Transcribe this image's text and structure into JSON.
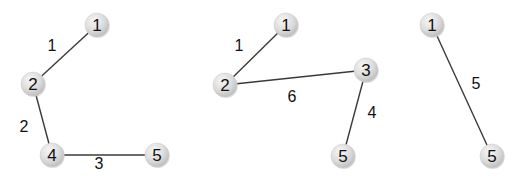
{
  "colors": {
    "background": "#ffffff",
    "edge": "#3a3a3a",
    "node_fill_light": "#f4f4f4",
    "node_fill_dark": "#c4c4c4",
    "text": "#111111"
  },
  "node_radius": 12,
  "graphs": [
    {
      "id": "graph-a",
      "nodes": [
        {
          "label": "1",
          "x": 97,
          "y": 25
        },
        {
          "label": "2",
          "x": 33,
          "y": 84
        },
        {
          "label": "4",
          "x": 52,
          "y": 155
        },
        {
          "label": "5",
          "x": 157,
          "y": 155
        }
      ],
      "edges": [
        {
          "from": "1",
          "to": "2",
          "weight": "1",
          "label_x": 52,
          "label_y": 45
        },
        {
          "from": "2",
          "to": "4",
          "weight": "2",
          "label_x": 24,
          "label_y": 126
        },
        {
          "from": "4",
          "to": "5",
          "weight": "3",
          "label_x": 99,
          "label_y": 163
        }
      ]
    },
    {
      "id": "graph-b",
      "nodes": [
        {
          "label": "1",
          "x": 286,
          "y": 25
        },
        {
          "label": "2",
          "x": 225,
          "y": 85
        },
        {
          "label": "3",
          "x": 366,
          "y": 70
        },
        {
          "label": "5",
          "x": 343,
          "y": 156
        }
      ],
      "edges": [
        {
          "from": "1",
          "to": "2",
          "weight": "1",
          "label_x": 239,
          "label_y": 45
        },
        {
          "from": "2",
          "to": "3",
          "weight": "6",
          "label_x": 292,
          "label_y": 96
        },
        {
          "from": "3",
          "to": "5",
          "weight": "4",
          "label_x": 372,
          "label_y": 112
        }
      ]
    },
    {
      "id": "graph-c",
      "nodes": [
        {
          "label": "1",
          "x": 432,
          "y": 25
        },
        {
          "label": "5",
          "x": 492,
          "y": 156
        }
      ],
      "edges": [
        {
          "from": "1",
          "to": "5",
          "weight": "5",
          "label_x": 476,
          "label_y": 83
        }
      ]
    }
  ]
}
